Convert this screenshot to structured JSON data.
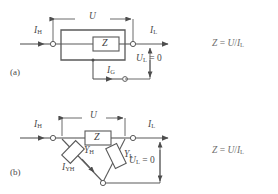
{
  "figure": {
    "type": "circuit-diagram",
    "background_color": "#ffffff",
    "line_color": "#5a5a5a",
    "text_color": "#4a4a4a"
  },
  "panels": [
    {
      "tag": "(a)",
      "dimension_label": "U",
      "element_label": "Z",
      "current_in": {
        "symbol": "I",
        "sub": "H"
      },
      "current_out": {
        "symbol": "I",
        "sub": "L"
      },
      "current_guard": {
        "symbol": "I",
        "sub": "G"
      },
      "voltage_low": {
        "symbol": "U",
        "sub": "L",
        "value": "= 0"
      },
      "formula": {
        "lhs": "Z",
        "eq": "=",
        "num": "U",
        "den": "I",
        "den_sub": "L"
      }
    },
    {
      "tag": "(b)",
      "dimension_label": "U",
      "element_label": "Z",
      "current_in": {
        "symbol": "I",
        "sub": "H"
      },
      "current_out": {
        "symbol": "I",
        "sub": "L"
      },
      "admittance_high": {
        "symbol": "Y",
        "sub": "H"
      },
      "admittance_low": {
        "symbol": "Y",
        "sub": "L"
      },
      "current_admittance": {
        "symbol": "I",
        "sub": "YH"
      },
      "voltage_low": {
        "symbol": "U",
        "sub": "L",
        "value": "= 0"
      },
      "formula": {
        "lhs": "Z",
        "eq": "=",
        "num": "U",
        "den": "I",
        "den_sub": "L"
      }
    }
  ]
}
